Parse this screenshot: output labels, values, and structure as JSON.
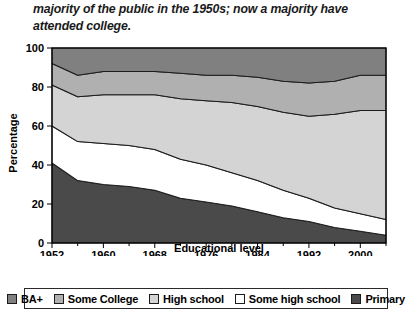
{
  "caption": "majority of the public in the 1950s; now a majority have attended college.",
  "chart_data": {
    "type": "area",
    "stacked": true,
    "title": "",
    "xlabel": "Educational level",
    "ylabel": "Percentage",
    "xlim": [
      1952,
      2004
    ],
    "ylim": [
      0,
      100
    ],
    "grid": false,
    "legend_position": "bottom",
    "x": [
      1952,
      1956,
      1960,
      1964,
      1968,
      1972,
      1976,
      1980,
      1984,
      1988,
      1992,
      1996,
      2000,
      2004
    ],
    "xticks": [
      1952,
      1960,
      1968,
      1976,
      1984,
      1992,
      2000
    ],
    "xtick_labels": [
      "1952",
      "1960",
      "1968",
      "1976",
      "1984",
      "1992",
      "2000"
    ],
    "xminor_step": 4,
    "yticks": [
      0,
      20,
      40,
      60,
      80,
      100
    ],
    "ytick_labels": [
      "0",
      "20",
      "40",
      "60",
      "80",
      "100"
    ],
    "series": [
      {
        "name": "Primary",
        "color": "#4a4a4a",
        "values": [
          41,
          32,
          30,
          29,
          27,
          23,
          21,
          19,
          16,
          13,
          11,
          8,
          6,
          4
        ]
      },
      {
        "name": "Some high school",
        "color": "#ffffff",
        "values": [
          19,
          20,
          21,
          21,
          21,
          20,
          19,
          17,
          16,
          14,
          12,
          10,
          9,
          8
        ]
      },
      {
        "name": "High school",
        "color": "#d4d4d4",
        "values": [
          21,
          23,
          25,
          26,
          28,
          31,
          33,
          36,
          38,
          40,
          42,
          48,
          53,
          56
        ]
      },
      {
        "name": "Some College",
        "color": "#b0b0b0",
        "values": [
          11,
          11,
          12,
          12,
          12,
          13,
          13,
          14,
          15,
          16,
          17,
          17,
          18,
          18
        ]
      },
      {
        "name": "BA+",
        "color": "#808080",
        "values": [
          8,
          14,
          12,
          12,
          12,
          13,
          14,
          14,
          15,
          17,
          18,
          17,
          14,
          14
        ]
      }
    ],
    "legend_order": [
      "BA+",
      "Some College",
      "High school",
      "Some high school",
      "Primary"
    ]
  }
}
